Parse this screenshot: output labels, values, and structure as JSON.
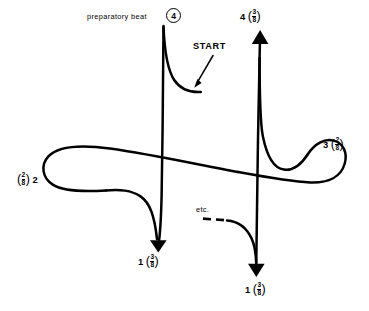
{
  "figure": {
    "type": "conducting-pattern-diagram",
    "background_color": "#ffffff",
    "stroke_color": "#000000",
    "width": 369,
    "height": 311
  },
  "annotations": {
    "preparatory_beat_text": "preparatory beat",
    "preparatory_beat_number": "4",
    "start_label": "START",
    "etc_label": "etc."
  },
  "beats": [
    {
      "id": "beat-4",
      "number": "4",
      "fraction_numerator": "3",
      "fraction_denominator": "8",
      "order": "number-then-fraction",
      "position": "top-right"
    },
    {
      "id": "beat-3",
      "number": "3",
      "fraction_numerator": "2",
      "fraction_denominator": "8",
      "order": "number-then-fraction",
      "position": "right"
    },
    {
      "id": "beat-2",
      "number": "2",
      "fraction_numerator": "2",
      "fraction_denominator": "8",
      "order": "fraction-then-number",
      "position": "left"
    },
    {
      "id": "beat-1-left",
      "number": "1",
      "fraction_numerator": "3",
      "fraction_denominator": "8",
      "order": "number-then-fraction",
      "position": "bottom-left"
    },
    {
      "id": "beat-1-right",
      "number": "1",
      "fraction_numerator": "3",
      "fraction_denominator": "8",
      "order": "number-then-fraction",
      "position": "bottom-right"
    }
  ],
  "paren_open": "(",
  "paren_close": ")"
}
